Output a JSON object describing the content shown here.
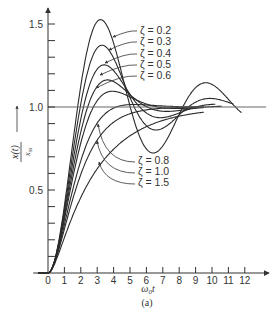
{
  "chart_data": {
    "type": "line",
    "title": "",
    "caption": "(a)",
    "xlabel": "ω₀t",
    "ylabel_num": "x(t)",
    "ylabel_den": "x_ss",
    "xlim": [
      0,
      12.5
    ],
    "ylim": [
      0,
      1.6
    ],
    "x_ticks": [
      0,
      1,
      2,
      3,
      4,
      5,
      6,
      7,
      8,
      9,
      10,
      11,
      12
    ],
    "x_tick_labels": [
      "0",
      "1",
      "2",
      "3",
      "4",
      "5",
      "6",
      "7",
      "8",
      "9",
      "10",
      "11",
      "12"
    ],
    "y_ticks": [
      0.1,
      0.2,
      0.3,
      0.4,
      0.5,
      0.6,
      0.7,
      0.8,
      0.9,
      1.0,
      1.1,
      1.2,
      1.3,
      1.4,
      1.5
    ],
    "y_tick_labels": [
      {
        "value": 0.5,
        "label": "0.5"
      },
      {
        "value": 1.0,
        "label": "1.0"
      },
      {
        "value": 1.5,
        "label": "1.5"
      }
    ],
    "reference_line": {
      "y": 1.0,
      "x_from": 0,
      "x_to": 13.3
    },
    "grid": false,
    "series": [
      {
        "name": "ζ = 0.2",
        "zeta": 0.2,
        "x_end": 11.8,
        "peak": {
          "x": 3.2,
          "y": 1.53
        }
      },
      {
        "name": "ζ = 0.3",
        "zeta": 0.3,
        "x_end": 11.3,
        "peak": {
          "x": 3.3,
          "y": 1.37
        }
      },
      {
        "name": "ζ = 0.4",
        "zeta": 0.4,
        "x_end": 10.2,
        "peak": {
          "x": 3.4,
          "y": 1.25
        }
      },
      {
        "name": "ζ = 0.5",
        "zeta": 0.5,
        "x_end": 10.6,
        "peak": {
          "x": 3.6,
          "y": 1.16
        }
      },
      {
        "name": "ζ = 0.6",
        "zeta": 0.6,
        "x_end": 9.5,
        "peak": {
          "x": 3.9,
          "y": 1.09
        }
      },
      {
        "name": "ζ = 0.8",
        "zeta": 0.8,
        "x_end": 9.5,
        "peak": {
          "x": 5.2,
          "y": 1.02
        }
      },
      {
        "name": "ζ = 1.0",
        "zeta": 1.0,
        "x_end": 9.5,
        "peak": null
      },
      {
        "name": "ζ = 1.5",
        "zeta": 1.5,
        "x_end": 9.5,
        "peak": null
      }
    ],
    "legend": {
      "position": "annotated-arrows",
      "upper": [
        {
          "label": "ζ = 0.2",
          "text_x": 140,
          "text_y": 34,
          "arrow_to": [
            113,
            37
          ]
        },
        {
          "label": "ζ = 0.3",
          "text_x": 140,
          "text_y": 45,
          "arrow_to": [
            109,
            50
          ]
        },
        {
          "label": "ζ = 0.4",
          "text_x": 140,
          "text_y": 57,
          "arrow_to": [
            105,
            63
          ]
        },
        {
          "label": "ζ = 0.5",
          "text_x": 140,
          "text_y": 68,
          "arrow_to": [
            100,
            75
          ]
        },
        {
          "label": "ζ = 0.6",
          "text_x": 140,
          "text_y": 79,
          "arrow_to": [
            96,
            88
          ]
        }
      ],
      "lower": [
        {
          "label": "ζ = 0.8",
          "text_x": 138,
          "text_y": 164,
          "arrow_from": [
            135,
            162
          ],
          "arrow_to": [
            98,
            124
          ]
        },
        {
          "label": "ζ = 1.0",
          "text_x": 138,
          "text_y": 175,
          "arrow_from": [
            135,
            173
          ],
          "arrow_to": [
            97,
            141
          ]
        },
        {
          "label": "ζ = 1.5",
          "text_x": 138,
          "text_y": 186,
          "arrow_from": [
            135,
            184
          ],
          "arrow_to": [
            99,
            162
          ]
        }
      ]
    }
  }
}
